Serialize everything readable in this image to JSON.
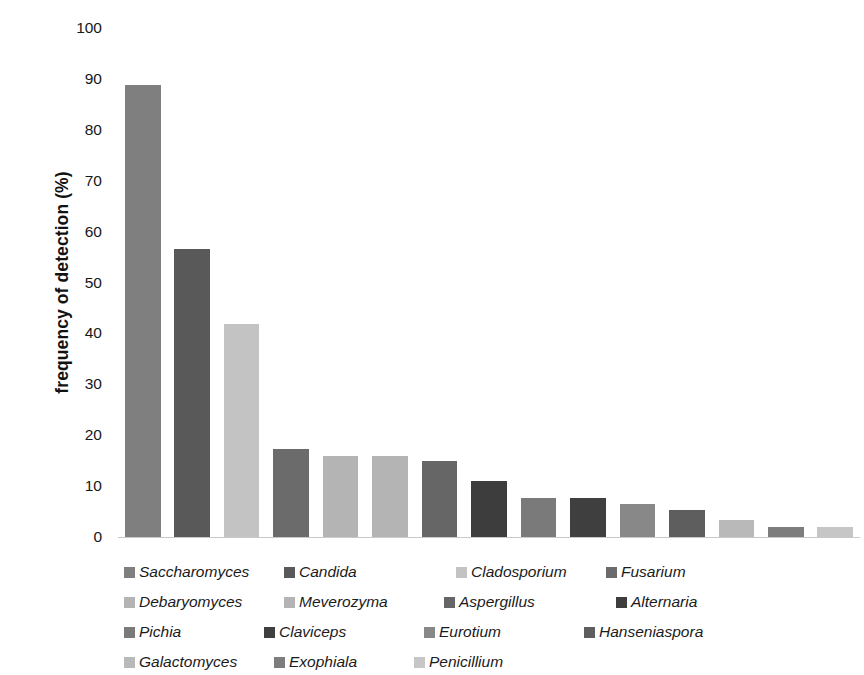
{
  "chart_data": {
    "type": "bar",
    "title": "",
    "xlabel": "",
    "ylabel": "frequency of detection (%)",
    "ylim": [
      0,
      100
    ],
    "ytick_labels": [
      "100",
      "90",
      "80",
      "70",
      "60",
      "50",
      "40",
      "30",
      "20",
      "10",
      "0"
    ],
    "yticks": [
      100,
      90,
      80,
      70,
      60,
      50,
      40,
      30,
      20,
      10,
      0
    ],
    "grid": false,
    "legend_position": "bottom",
    "categories": [
      "Saccharomyces",
      "Candida",
      "Cladosporium",
      "Fusarium",
      "Debaryomyces",
      "Meverozyma",
      "Aspergillus",
      "Alternaria",
      "Pichia",
      "Claviceps",
      "Eurotium",
      "Hanseniaspora",
      "Galactomyces",
      "Exophiala",
      "Penicillium"
    ],
    "values": [
      88.8,
      56.6,
      41.8,
      17.3,
      16.0,
      16.0,
      14.9,
      11.0,
      7.7,
      7.7,
      6.5,
      5.4,
      3.3,
      2.0,
      1.9
    ],
    "colors": [
      "#7f7f7f",
      "#595959",
      "#c3c3c3",
      "#6b6b6b",
      "#b4b4b4",
      "#b4b4b4",
      "#666666",
      "#3d3d3d",
      "#7a7a7a",
      "#3f3f3f",
      "#888888",
      "#5e5e5e",
      "#b9b9b9",
      "#7d7d7d",
      "#c6c6c6"
    ]
  },
  "legend": {
    "items": [
      {
        "label": "Saccharomyces",
        "color": "#7f7f7f"
      },
      {
        "label": "Candida",
        "color": "#595959"
      },
      {
        "label": "Cladosporium",
        "color": "#c3c3c3"
      },
      {
        "label": "Fusarium",
        "color": "#6b6b6b"
      },
      {
        "label": "Debaryomyces",
        "color": "#b4b4b4"
      },
      {
        "label": "Meverozyma",
        "color": "#b4b4b4"
      },
      {
        "label": "Aspergillus",
        "color": "#666666"
      },
      {
        "label": "Alternaria",
        "color": "#3d3d3d"
      },
      {
        "label": "Pichia",
        "color": "#7a7a7a"
      },
      {
        "label": "Claviceps",
        "color": "#3f3f3f"
      },
      {
        "label": "Eurotium",
        "color": "#888888"
      },
      {
        "label": "Hanseniaspora",
        "color": "#5e5e5e"
      },
      {
        "label": "Galactomyces",
        "color": "#b9b9b9"
      },
      {
        "label": "Exophiala",
        "color": "#7d7d7d"
      },
      {
        "label": "Penicillium",
        "color": "#c6c6c6"
      }
    ]
  }
}
